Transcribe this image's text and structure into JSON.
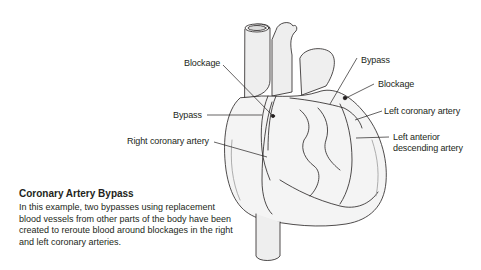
{
  "figure": {
    "labels": {
      "blockage_right": "Blockage",
      "bypass_right": "Bypass",
      "right_coronary_artery": "Right coronary artery",
      "bypass_left": "Bypass",
      "blockage_left": "Blockage",
      "left_coronary_artery": "Left coronary artery",
      "lad_line1": "Left anterior",
      "lad_line2": "descending artery"
    }
  },
  "caption": {
    "title": "Coronary Artery Bypass",
    "body": "In this example, two bypasses using replacement blood vessels from other parts of the body have been created to reroute blood around blockages in the right and left coronary arteries."
  },
  "colors": {
    "line": "#231f20",
    "heart_fill": "#f2f2f2",
    "shade": "#bdbdbd"
  }
}
